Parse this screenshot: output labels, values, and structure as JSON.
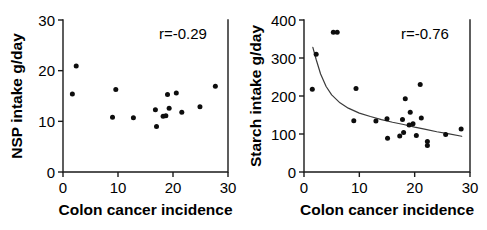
{
  "figure": {
    "background_color": "#ffffff",
    "point_color": "#0d0d0d",
    "axis_color": "#1a1a1a",
    "curve_color": "#3a3a3a"
  },
  "chart_data": [
    {
      "type": "scatter",
      "panel": "left",
      "title": "",
      "xlabel": "Colon cancer incidence",
      "ylabel": "NSP intake g/day",
      "xlim": [
        0,
        30
      ],
      "ylim": [
        0,
        30
      ],
      "xticks": [
        0,
        10,
        20,
        30
      ],
      "yticks": [
        0,
        10,
        20,
        30
      ],
      "xtick_labels": [
        "0",
        "10",
        "20",
        "30"
      ],
      "ytick_labels": [
        "0",
        "10",
        "20",
        "30"
      ],
      "grid": false,
      "legend": false,
      "annotation": "r=-0.29",
      "correlation": -0.29,
      "trend_curve": false,
      "points": [
        {
          "x": 2.4,
          "y": 20.9
        },
        {
          "x": 1.7,
          "y": 15.4
        },
        {
          "x": 9.6,
          "y": 16.3
        },
        {
          "x": 9.0,
          "y": 10.8
        },
        {
          "x": 12.8,
          "y": 10.7
        },
        {
          "x": 16.8,
          "y": 12.3
        },
        {
          "x": 17.0,
          "y": 9.0
        },
        {
          "x": 18.2,
          "y": 11.0
        },
        {
          "x": 18.7,
          "y": 11.1
        },
        {
          "x": 19.0,
          "y": 15.3
        },
        {
          "x": 19.3,
          "y": 12.6
        },
        {
          "x": 20.6,
          "y": 15.6
        },
        {
          "x": 21.6,
          "y": 11.8
        },
        {
          "x": 24.9,
          "y": 12.9
        },
        {
          "x": 27.7,
          "y": 16.9
        }
      ]
    },
    {
      "type": "scatter",
      "panel": "right",
      "title": "",
      "xlabel": "Colon cancer incidence",
      "ylabel": "Starch intake g/day",
      "xlim": [
        0,
        30
      ],
      "ylim": [
        0,
        400
      ],
      "xticks": [
        0,
        10,
        20,
        30
      ],
      "yticks": [
        0,
        100,
        200,
        300,
        400
      ],
      "xtick_labels": [
        "0",
        "10",
        "20",
        "30"
      ],
      "ytick_labels": [
        "0",
        "100",
        "200",
        "300",
        "400"
      ],
      "grid": false,
      "legend": false,
      "annotation": "r=-0.76",
      "correlation": -0.76,
      "trend_curve": true,
      "trend_curve_points": [
        {
          "x": 1.6,
          "y": 328
        },
        {
          "x": 2.2,
          "y": 296
        },
        {
          "x": 3.0,
          "y": 258
        },
        {
          "x": 4.0,
          "y": 225
        },
        {
          "x": 5.0,
          "y": 203
        },
        {
          "x": 6.5,
          "y": 182
        },
        {
          "x": 8.0,
          "y": 168
        },
        {
          "x": 10.0,
          "y": 155
        },
        {
          "x": 12.0,
          "y": 146
        },
        {
          "x": 14.0,
          "y": 138
        },
        {
          "x": 16.0,
          "y": 131
        },
        {
          "x": 18.0,
          "y": 125
        },
        {
          "x": 20.0,
          "y": 118
        },
        {
          "x": 22.0,
          "y": 112
        },
        {
          "x": 24.0,
          "y": 106
        },
        {
          "x": 26.0,
          "y": 101
        },
        {
          "x": 28.5,
          "y": 94
        }
      ],
      "points": [
        {
          "x": 5.3,
          "y": 368
        },
        {
          "x": 6.0,
          "y": 368
        },
        {
          "x": 2.2,
          "y": 310
        },
        {
          "x": 1.5,
          "y": 218
        },
        {
          "x": 9.4,
          "y": 220
        },
        {
          "x": 21.0,
          "y": 230
        },
        {
          "x": 18.3,
          "y": 193
        },
        {
          "x": 19.2,
          "y": 157
        },
        {
          "x": 21.2,
          "y": 142
        },
        {
          "x": 15.0,
          "y": 140
        },
        {
          "x": 17.8,
          "y": 138
        },
        {
          "x": 9.0,
          "y": 135
        },
        {
          "x": 13.0,
          "y": 134
        },
        {
          "x": 19.7,
          "y": 127
        },
        {
          "x": 19.0,
          "y": 124
        },
        {
          "x": 18.0,
          "y": 104
        },
        {
          "x": 20.3,
          "y": 96
        },
        {
          "x": 17.3,
          "y": 95
        },
        {
          "x": 15.1,
          "y": 89
        },
        {
          "x": 22.3,
          "y": 80
        },
        {
          "x": 22.3,
          "y": 70
        },
        {
          "x": 25.6,
          "y": 99
        },
        {
          "x": 28.4,
          "y": 113
        }
      ]
    }
  ]
}
